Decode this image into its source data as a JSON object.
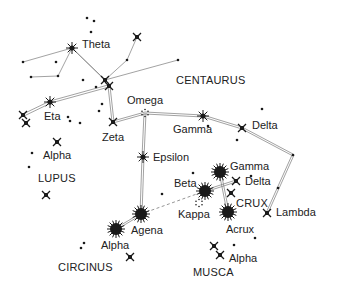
{
  "colors": {
    "background": "#ffffff",
    "star": "#1a1a1a",
    "line": "#8a8a8a",
    "text": "#222222"
  },
  "constellations": [
    {
      "name": "CENTAURUS",
      "x": 176,
      "y": 84
    },
    {
      "name": "LUPUS",
      "x": 38,
      "y": 182
    },
    {
      "name": "CIRCINUS",
      "x": 58,
      "y": 271
    },
    {
      "name": "CRUX",
      "x": 236,
      "y": 207
    },
    {
      "name": "MUSCA",
      "x": 193,
      "y": 276
    }
  ],
  "stars": [
    {
      "id": "theta",
      "label": "Theta",
      "type": "burst",
      "x": 72,
      "y": 48,
      "lx": 82,
      "ly": 48
    },
    {
      "id": "top-right",
      "label": "",
      "type": "x",
      "x": 137,
      "y": 37
    },
    {
      "id": "junction-a",
      "label": "",
      "type": "x",
      "x": 105,
      "y": 80
    },
    {
      "id": "junction-b",
      "label": "",
      "type": "x",
      "x": 109,
      "y": 86
    },
    {
      "id": "omega",
      "label": "Omega",
      "type": "cluster",
      "x": 145,
      "y": 113,
      "lx": 127,
      "ly": 104
    },
    {
      "id": "zeta",
      "label": "Zeta",
      "type": "x",
      "x": 113,
      "y": 122,
      "lx": 102,
      "ly": 141
    },
    {
      "id": "eta",
      "label": "Eta",
      "type": "burst",
      "x": 50,
      "y": 102,
      "lx": 44,
      "ly": 120
    },
    {
      "id": "eta-left-a",
      "label": "",
      "type": "x",
      "x": 23,
      "y": 115
    },
    {
      "id": "eta-left-b",
      "label": "",
      "type": "x",
      "x": 26,
      "y": 123
    },
    {
      "id": "alpha-lupus",
      "label": "Alpha",
      "type": "x",
      "x": 57,
      "y": 142,
      "lx": 43,
      "ly": 159
    },
    {
      "id": "lupus-x",
      "label": "",
      "type": "x",
      "x": 46,
      "y": 195
    },
    {
      "id": "gamma-cen",
      "label": "Gamma",
      "type": "burst",
      "x": 203,
      "y": 116,
      "lx": 173,
      "ly": 133
    },
    {
      "id": "delta-cen",
      "label": "Delta",
      "type": "x",
      "x": 242,
      "y": 128,
      "lx": 252,
      "ly": 129
    },
    {
      "id": "epsilon",
      "label": "Epsilon",
      "type": "burst",
      "x": 143,
      "y": 157,
      "lx": 153,
      "ly": 161
    },
    {
      "id": "lambda",
      "label": "Lambda",
      "type": "x",
      "x": 267,
      "y": 213,
      "lx": 276,
      "ly": 216
    },
    {
      "id": "agena",
      "label": "Agena",
      "type": "big",
      "x": 141,
      "y": 214,
      "lx": 131,
      "ly": 234
    },
    {
      "id": "alpha-cen",
      "label": "Alpha",
      "type": "big",
      "x": 116,
      "y": 229,
      "lx": 101,
      "ly": 249
    },
    {
      "id": "circinus-x",
      "label": "",
      "type": "x",
      "x": 130,
      "y": 257
    },
    {
      "id": "gamma-crux",
      "label": "Gamma",
      "type": "big",
      "x": 220,
      "y": 172,
      "lx": 230,
      "ly": 170
    },
    {
      "id": "delta-crux",
      "label": "Delta",
      "type": "x",
      "x": 236,
      "y": 181,
      "lx": 245,
      "ly": 185
    },
    {
      "id": "beta-crux",
      "label": "Beta",
      "type": "big",
      "x": 205,
      "y": 191,
      "lx": 174,
      "ly": 187
    },
    {
      "id": "kappa",
      "label": "Kappa",
      "type": "cluster",
      "x": 199,
      "y": 203,
      "lx": 178,
      "ly": 218
    },
    {
      "id": "crux-inner",
      "label": "",
      "type": "x",
      "x": 231,
      "y": 193
    },
    {
      "id": "acrux",
      "label": "Acrux",
      "type": "big",
      "x": 228,
      "y": 212,
      "lx": 226,
      "ly": 233
    },
    {
      "id": "musca-a",
      "label": "",
      "type": "x",
      "x": 214,
      "y": 246
    },
    {
      "id": "musca-alpha",
      "label": "Alpha",
      "type": "x",
      "x": 220,
      "y": 255,
      "lx": 229,
      "ly": 262
    }
  ],
  "dim_stars": [
    [
      87,
      18
    ],
    [
      94,
      21
    ],
    [
      91,
      32
    ],
    [
      127,
      60
    ],
    [
      23,
      62
    ],
    [
      56,
      62
    ],
    [
      31,
      77
    ],
    [
      58,
      76
    ],
    [
      83,
      80
    ],
    [
      96,
      87
    ],
    [
      102,
      104
    ],
    [
      99,
      111
    ],
    [
      68,
      117
    ],
    [
      70,
      121
    ],
    [
      80,
      123
    ],
    [
      32,
      153
    ],
    [
      29,
      167
    ],
    [
      262,
      109
    ],
    [
      208,
      126
    ],
    [
      237,
      140
    ],
    [
      293,
      155
    ],
    [
      278,
      188
    ],
    [
      193,
      173
    ],
    [
      251,
      176
    ],
    [
      255,
      238
    ],
    [
      234,
      245
    ],
    [
      84,
      243
    ],
    [
      81,
      248
    ],
    [
      162,
      194
    ],
    [
      178,
      60
    ]
  ]
}
